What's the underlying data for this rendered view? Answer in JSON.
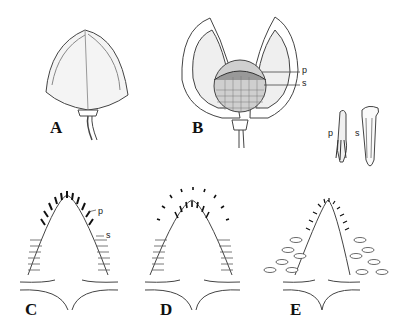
{
  "figure": {
    "panels": [
      {
        "id": "A",
        "label": "A",
        "description": "closed fruit capsule on stalk"
      },
      {
        "id": "B",
        "label": "B",
        "description": "open capsule showing seed mass",
        "annotations": [
          "p",
          "s"
        ]
      },
      {
        "id": "ps",
        "annotations": [
          "p",
          "s"
        ],
        "description": "detached p and s structures"
      },
      {
        "id": "C",
        "label": "C",
        "annotations": [
          "p",
          "s"
        ]
      },
      {
        "id": "D",
        "label": "D"
      },
      {
        "id": "E",
        "label": "E"
      }
    ]
  }
}
